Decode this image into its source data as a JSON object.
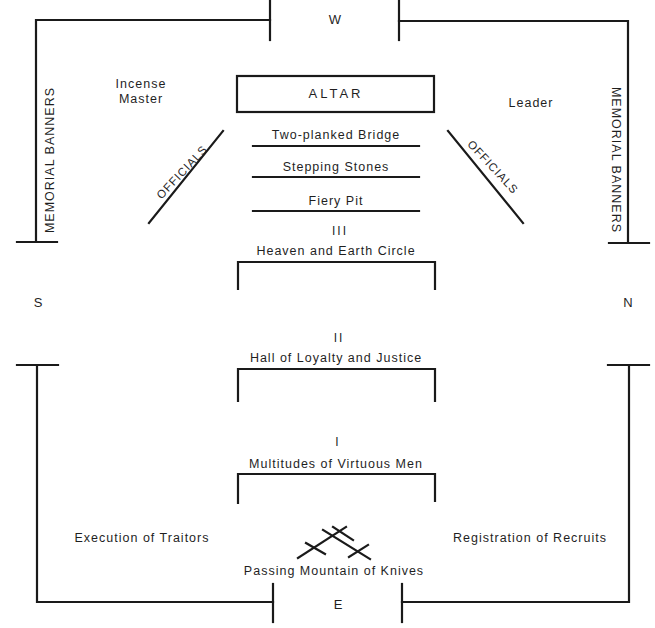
{
  "compass": {
    "west": "W",
    "east": "E",
    "south": "S",
    "north": "N"
  },
  "altar": {
    "label": "ALTAR"
  },
  "people": {
    "incense_master_line1": "Incense",
    "incense_master_line2": "Master",
    "leader": "Leader"
  },
  "banners": {
    "left": "MEMORIAL BANNERS",
    "right": "MEMORIAL BANNERS"
  },
  "officials": {
    "left": "OFFICIALS",
    "right": "OFFICIALS"
  },
  "passages": [
    {
      "label": "Two-planked Bridge"
    },
    {
      "label": "Stepping Stones"
    },
    {
      "label": "Fiery Pit"
    }
  ],
  "gates": [
    {
      "numeral": "III",
      "label": "Heaven and Earth Circle"
    },
    {
      "numeral": "II",
      "label": "Hall of Loyalty and Justice"
    },
    {
      "numeral": "I",
      "label": "Multitudes of Virtuous Men"
    }
  ],
  "stations": {
    "execution": "Execution of Traitors",
    "registration": "Registration of Recruits",
    "knives": "Passing Mountain of Knives"
  },
  "colors": {
    "ink": "#1a1a1a",
    "background": "#ffffff"
  }
}
